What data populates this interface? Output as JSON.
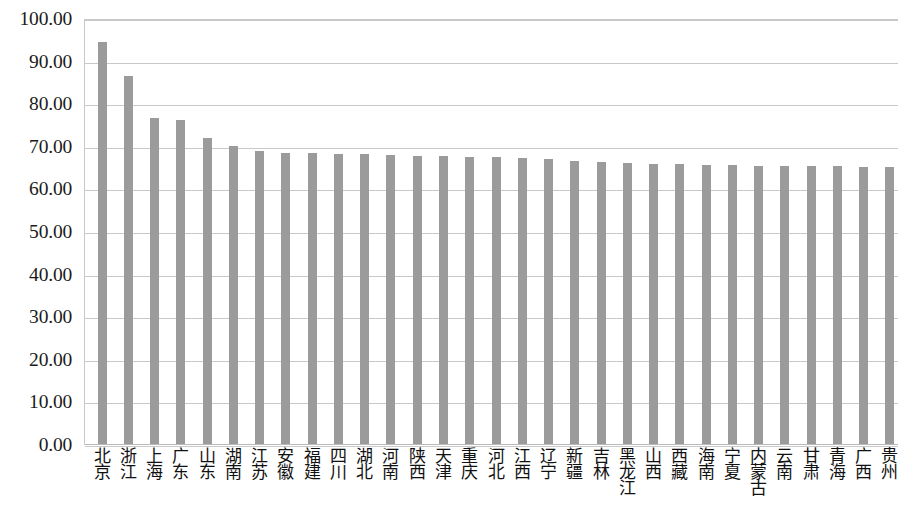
{
  "chart_data": {
    "type": "bar",
    "title": "",
    "subtitle": "",
    "xlabel": "",
    "ylabel": "",
    "ylim": [
      0,
      100
    ],
    "xlim": null,
    "grid": true,
    "grid_axis": "y",
    "legend": false,
    "legend_position": "none",
    "bar_color": "#9b9b9b",
    "gridline_color": "#c9c9c9",
    "y_ticks": [
      0,
      10,
      20,
      30,
      40,
      50,
      60,
      70,
      80,
      90,
      100
    ],
    "y_tick_labels": [
      "0.00",
      "10.00",
      "20.00",
      "30.00",
      "40.00",
      "50.00",
      "60.00",
      "70.00",
      "80.00",
      "90.00",
      "100.00"
    ],
    "categories": [
      "北京",
      "浙江",
      "上海",
      "广东",
      "山东",
      "湖南",
      "江苏",
      "安徽",
      "福建",
      "四川",
      "湖北",
      "河南",
      "陕西",
      "天津",
      "重庆",
      "河北",
      "江西",
      "辽宁",
      "新疆",
      "吉林",
      "黑龙江",
      "山西",
      "西藏",
      "海南",
      "宁夏",
      "内蒙古",
      "云南",
      "甘肃",
      "青海",
      "广西",
      "贵州"
    ],
    "values": [
      94.7,
      86.6,
      76.8,
      76.2,
      72.1,
      70.1,
      69.0,
      68.6,
      68.5,
      68.4,
      68.4,
      68.1,
      67.9,
      67.8,
      67.7,
      67.5,
      67.4,
      67.2,
      66.6,
      66.4,
      66.2,
      66.0,
      65.9,
      65.8,
      65.7,
      65.6,
      65.6,
      65.5,
      65.4,
      65.3,
      65.2
    ],
    "series": [
      {
        "name": "",
        "values": [
          94.7,
          86.6,
          76.8,
          76.2,
          72.1,
          70.1,
          69.0,
          68.6,
          68.5,
          68.4,
          68.4,
          68.1,
          67.9,
          67.8,
          67.7,
          67.5,
          67.4,
          67.2,
          66.6,
          66.4,
          66.2,
          66.0,
          65.9,
          65.8,
          65.7,
          65.6,
          65.6,
          65.5,
          65.4,
          65.3,
          65.2
        ]
      }
    ]
  }
}
